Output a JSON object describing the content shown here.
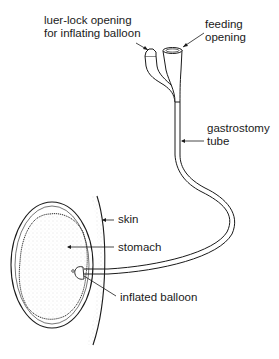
{
  "labels": {
    "luer_lock_line1": "luer-lock opening",
    "luer_lock_line2": "for inflating balloon",
    "feeding_line1": "feeding",
    "feeding_line2": "opening",
    "tube_line1": "gastrostomy",
    "tube_line2": "tube",
    "skin": "skin",
    "stomach": "stomach",
    "balloon": "inflated balloon"
  },
  "colors": {
    "ink": "#1a1a1a",
    "background": "#ffffff",
    "stipple": "#d8d8d8"
  }
}
